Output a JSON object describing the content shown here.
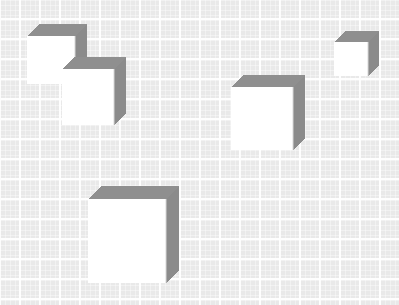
{
  "scene": {
    "title": "Isometric white cubes on graph paper grid",
    "width": 399,
    "height": 305,
    "background_color": "#e9e9e9",
    "grid_line_color": "#ffffff",
    "grid_spacing_px": 20,
    "grid_minor_spacing_px": 5
  },
  "palette": {
    "front_face": "#ffffff",
    "top_face": "#8f8f8f",
    "right_face": "#8b8b8b",
    "edge_line": "#7f7f7f",
    "front_shadow_edge": "#d8d8d8"
  },
  "cubes": [
    {
      "id": "cube-top-left-upper",
      "label": "Upper left cube",
      "x": 27,
      "y": 24,
      "front_width": 48,
      "front_height": 48,
      "depth": 12
    },
    {
      "id": "cube-top-left-lower",
      "label": "Lower left cube",
      "x": 62,
      "y": 57,
      "front_width": 52,
      "front_height": 56,
      "depth": 12
    },
    {
      "id": "cube-center",
      "label": "Center cube",
      "x": 231,
      "y": 75,
      "front_width": 62,
      "front_height": 63,
      "depth": 12
    },
    {
      "id": "cube-top-right",
      "label": "Top right small cube",
      "x": 334,
      "y": 31,
      "front_width": 34,
      "front_height": 34,
      "depth": 11
    },
    {
      "id": "cube-bottom",
      "label": "Bottom cube",
      "x": 88,
      "y": 186,
      "front_width": 78,
      "front_height": 84,
      "depth": 13
    }
  ]
}
